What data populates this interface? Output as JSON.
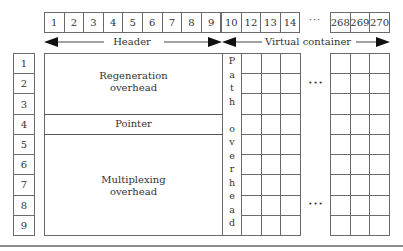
{
  "header_row": {
    "left_cells": [
      "1",
      "2",
      "3",
      "4",
      "5",
      "6",
      "7",
      "8",
      "9"
    ],
    "mid_cells": [
      "10",
      "12",
      "13",
      "14"
    ],
    "ellipsis": "···",
    "right_cells": [
      "268",
      "269",
      "270"
    ]
  },
  "spans": {
    "header_label": "Header",
    "virtual_container_label": "Virtual container"
  },
  "row_index": [
    "1",
    "2",
    "3",
    "4",
    "5",
    "6",
    "7",
    "8",
    "9"
  ],
  "blocks": {
    "regeneration": [
      "Regeneration",
      "overhead"
    ],
    "pointer": "Pointer",
    "multiplexing": [
      "Multiplexing",
      "overhead"
    ]
  },
  "path_overhead_letters": [
    "P",
    "a",
    "t",
    "h",
    "",
    "o",
    "v",
    "e",
    "r",
    "h",
    "e",
    "a",
    "d"
  ],
  "grid": {
    "rows": 9,
    "left_columns": 3,
    "right_columns": 3,
    "ellipsis": "•••"
  },
  "colors": {
    "line": "#6a6a6a",
    "text": "#333333",
    "arrow": "#111111"
  }
}
